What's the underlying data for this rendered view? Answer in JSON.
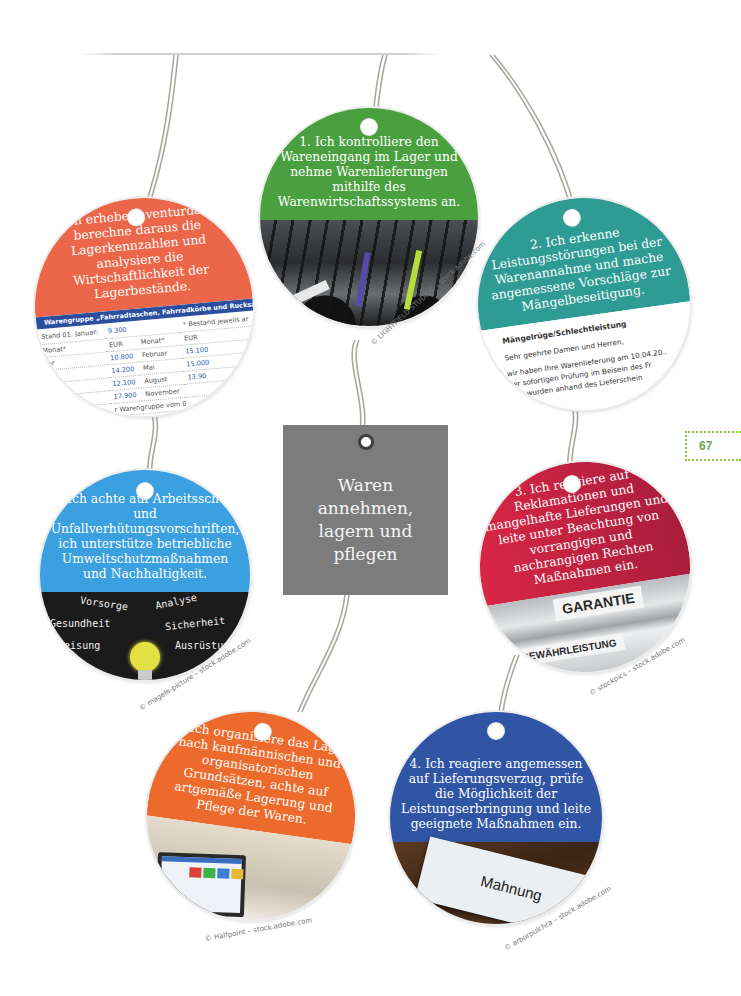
{
  "page": {
    "number": "67",
    "accent_color": "#8dc63f"
  },
  "center_card": {
    "title_lines": [
      "Waren",
      "annehmen,",
      "lagern und",
      "pflegen"
    ],
    "color": "#7c7c7c"
  },
  "tags": [
    {
      "id": 1,
      "color": "#4a9f3f",
      "text": "1. Ich kontrolliere den Wareneingang im Lager und nehme Warenlieferungen mithilfe des Warenwirtschaftssystems an.",
      "image": "bicycles-in-store",
      "credit": "© LIGHTFIELD STUDIOS – stock.adobe.com"
    },
    {
      "id": 2,
      "color": "#2e9b94",
      "text": "2. Ich erkenne Leistungsstörungen bei der Warenannahme und mache angemessene Vorschläge zur Mängelbeseitigung.",
      "image": "complaint-letter",
      "letter": {
        "heading": "Mängelrüge/Schlechtleistung",
        "lines": [
          "Sehr geehrte Damen und Herren,",
          "wir haben Ihre Warenlieferung am 10.04.20..",
          "der sofortigen Prüfung im Beisein des Fr",
          "mer wurden anhand des Lieferschein",
          "Sie auch der beiliegenden K"
        ]
      }
    },
    {
      "id": 3,
      "color": "#c4243e",
      "text": "3. Ich reagiere auf Reklamationen und mangelhafte Lieferungen und leite unter Beachtung von vorrangigen und nachrangigen Rechten Maßnahmen ein.",
      "image": "binders",
      "labels": [
        "GARANTIE",
        "GEWÄHRLEISTUNG"
      ],
      "credit": "© stockpics – stock.adobe.com"
    },
    {
      "id": 4,
      "color": "#2f55a4",
      "text": "4. Ich reagiere angemessen auf Lieferungsverzug, prüfe die Möglichkeit der Leistungserbringung und leite geeignete Maßnahmen ein.",
      "image": "envelope",
      "envelope_label": "Mahnung",
      "credit": "© arborpulchra – stock.adobe.com"
    },
    {
      "id": 5,
      "color": "#ec6a2c",
      "text": "5. Ich organisiere das Lager nach kaufmännischen und organisatorischen Grundsätzen, achte auf artgemäße Lagerung und Pflege der Waren.",
      "image": "laptop-warehouse",
      "credit": "© Halfpoint – stock.adobe.com"
    },
    {
      "id": 6,
      "color": "#3aa0e0",
      "text": "6. Ich achte auf Arbeitsschutz und Unfallverhütungsvorschriften, ich unterstütze betriebliche Umweltschutzmaßnahmen und Nachhaltigkeit.",
      "image": "chalkboard-bulb",
      "chalk_words": [
        "Vorsorge",
        "Analyse",
        "Gesundheit",
        "Sicherheit",
        "terweisung",
        "Ausrüstun"
      ],
      "credit": "© magele-picture – stock.adobe.com"
    },
    {
      "id": 7,
      "color": "#ec6649",
      "text": "7. Ich erhebe Inventurdaten, berechne daraus die Lagerkennzahlen und analysiere die Wirtschaftlichkeit der Lagerbestände.",
      "image": "inventory-table",
      "table": {
        "title": "Warengruppe „Fahrradtaschen, Fahrradkörbe und Rucksäcke\"",
        "note": "* Bestand jeweils ar",
        "stand_label": "Stand 01. Januar:",
        "stand_value": "9.300",
        "header": [
          "Monat*",
          "EUR",
          "Monat*",
          "EUR"
        ],
        "rows": [
          [
            "uar",
            "10.800",
            "Februar",
            "15.100"
          ],
          [
            "",
            "14.200",
            "Mai",
            "15.000"
          ],
          [
            "",
            "12.100",
            "August",
            "13.90"
          ],
          [
            "",
            "17.900",
            "November",
            ""
          ]
        ],
        "footer": "r Warengruppe vom 0"
      }
    }
  ]
}
